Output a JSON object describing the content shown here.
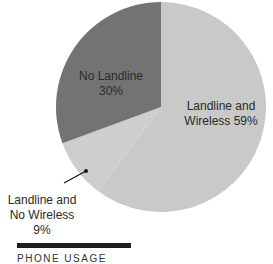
{
  "chart_data": {
    "type": "pie",
    "title": "",
    "slices": [
      {
        "label": "Landline and Wireless",
        "value": 59,
        "color": "#c9c9c9"
      },
      {
        "label": "Landline and No Wireless",
        "value": 9,
        "color": "#cecece"
      },
      {
        "label": "No Landline",
        "value": 30,
        "color": "#737373"
      }
    ],
    "start_angle_deg": 0,
    "direction": "clockwise",
    "legend": "none",
    "annotations": [
      "Leader line points to 'Landline and No Wireless' slice"
    ]
  },
  "labels": {
    "no_landline": {
      "line1": "No Landline",
      "line2": "30%"
    },
    "landline_wireless": {
      "line1": "Landline and",
      "line2": "Wireless 59%"
    },
    "landline_no_wireless": {
      "line1": "Landline and",
      "line2": "No Wireless",
      "line3": "9%"
    }
  },
  "caption": {
    "text": "PHONE USAGE"
  },
  "colors": {
    "bar": "#1e1e1e",
    "leader_line": "#1a1a1a"
  }
}
